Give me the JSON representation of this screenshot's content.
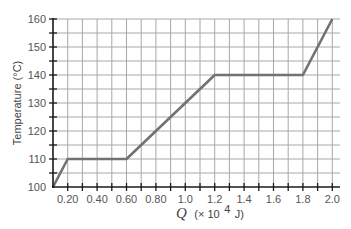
{
  "chart_data": {
    "type": "line",
    "title": "",
    "xlabel": "Q (× 10^4 J)",
    "xlabel_parts": {
      "symbol": "Q",
      "unit": "(× 10",
      "exp": "4",
      "tail": " J)"
    },
    "ylabel": "Temperature (°C)",
    "xlim": [
      0.1,
      2.0
    ],
    "ylim": [
      100,
      160
    ],
    "grid": true,
    "x_grid_step": 0.1,
    "y_grid_step": 5,
    "x_ticks": [
      0.2,
      0.4,
      0.6,
      0.8,
      1.0,
      1.2,
      1.4,
      1.6,
      1.8,
      2.0
    ],
    "x_tick_labels": [
      "0.20",
      "0.40",
      "0.60",
      "0.80",
      "1.0",
      "1.2",
      "1.4",
      "1.6",
      "1.8",
      "2.0"
    ],
    "y_ticks": [
      100,
      110,
      120,
      130,
      140,
      150,
      160
    ],
    "y_tick_labels": [
      "100",
      "110",
      "120",
      "130",
      "140",
      "150",
      "160"
    ],
    "legend": null,
    "series": [
      {
        "name": "Temperature vs heat added",
        "x": [
          0.1,
          0.2,
          0.6,
          1.2,
          1.8,
          2.0
        ],
        "y": [
          100,
          110,
          110,
          140,
          140,
          160
        ]
      }
    ],
    "colors": {
      "line": "#727272",
      "grid": "#a8a8a8",
      "axis": "#1a1a1a"
    }
  }
}
